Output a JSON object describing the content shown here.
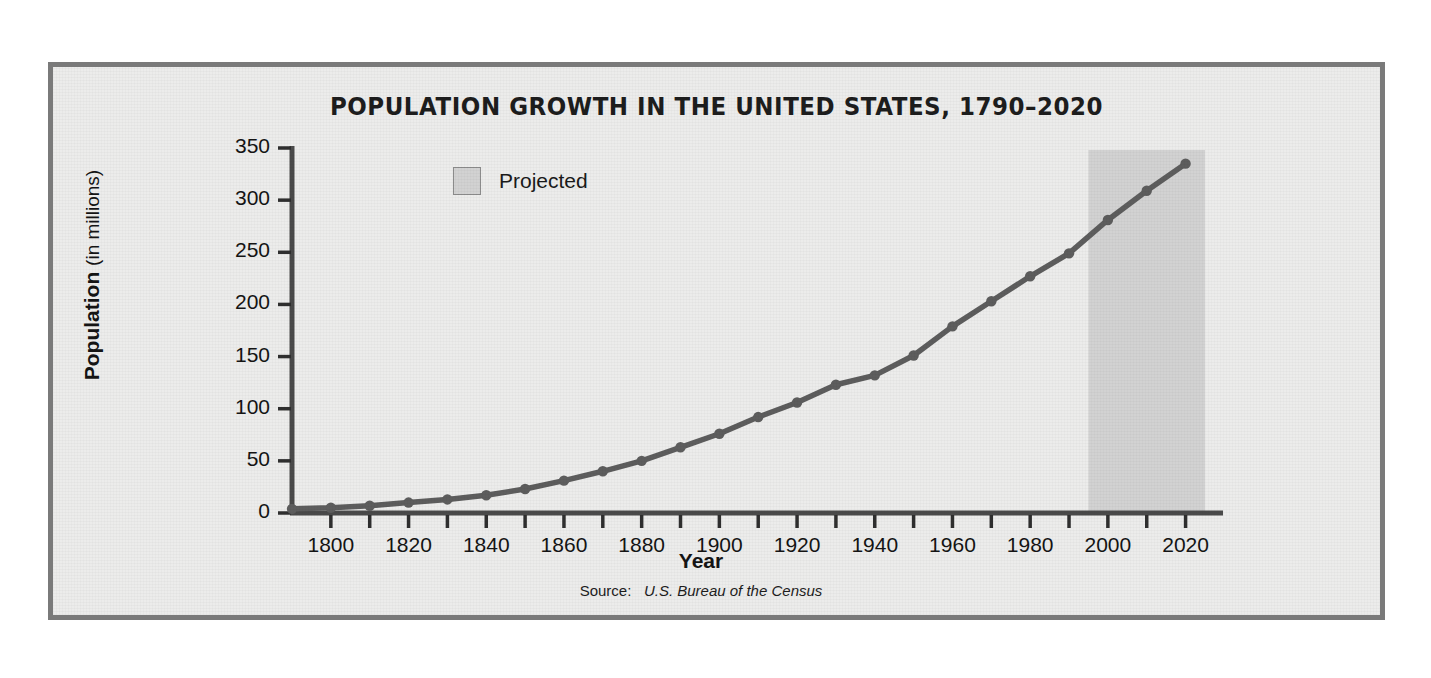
{
  "figure": {
    "title": "POPULATION GROWTH IN THE UNITED STATES, 1790–2020",
    "source_label": "Source:",
    "source_value": "U.S. Bureau of the Census",
    "border_color": "#7a7a7a",
    "background_color": "#ececeb"
  },
  "legend": {
    "items": [
      {
        "label": "Projected",
        "color": "#d2d2d2"
      }
    ]
  },
  "axes": {
    "y_title_bold": "Population",
    "y_title_regular": "(in millions)",
    "x_title": "Year"
  },
  "chart_data": {
    "type": "line",
    "title": "POPULATION GROWTH IN THE UNITED STATES, 1790–2020",
    "xlabel": "Year",
    "ylabel": "Population (in millions)",
    "xlim": [
      1790,
      2025
    ],
    "ylim": [
      0,
      350
    ],
    "grid": false,
    "legend_position": "upper-left-inside",
    "line_color": "#5d5d5d",
    "marker_color": "#5d5d5d",
    "y_ticks": [
      0,
      50,
      100,
      150,
      200,
      250,
      300,
      350
    ],
    "y_tick_labels": [
      "0",
      "50",
      "100",
      "150",
      "200",
      "250",
      "300",
      "350"
    ],
    "x_ticks": [
      1800,
      1810,
      1820,
      1830,
      1840,
      1850,
      1860,
      1870,
      1880,
      1890,
      1900,
      1910,
      1920,
      1930,
      1940,
      1950,
      1960,
      1970,
      1980,
      1990,
      2000,
      2010,
      2020
    ],
    "x_tick_labels_shown": [
      "1800",
      "1820",
      "1840",
      "1860",
      "1880",
      "1900",
      "1920",
      "1940",
      "1960",
      "1980",
      "2000",
      "2020"
    ],
    "x_tick_label_step": 20,
    "annotations": [
      {
        "type": "shaded-band",
        "label": "Projected",
        "x_start": 1995,
        "x_end": 2025,
        "color": "#d2d2d2"
      }
    ],
    "x": [
      1790,
      1800,
      1810,
      1820,
      1830,
      1840,
      1850,
      1860,
      1870,
      1880,
      1890,
      1900,
      1910,
      1920,
      1930,
      1940,
      1950,
      1960,
      1970,
      1980,
      1990,
      2000,
      2010,
      2020
    ],
    "values": [
      4,
      5,
      7,
      10,
      13,
      17,
      23,
      31,
      40,
      50,
      63,
      76,
      92,
      106,
      123,
      132,
      151,
      179,
      203,
      227,
      249,
      281,
      309,
      335
    ],
    "series": [
      {
        "name": "U.S. population",
        "values": [
          4,
          5,
          7,
          10,
          13,
          17,
          23,
          31,
          40,
          50,
          63,
          76,
          92,
          106,
          123,
          132,
          151,
          179,
          203,
          227,
          249,
          281,
          309,
          335
        ]
      }
    ]
  }
}
